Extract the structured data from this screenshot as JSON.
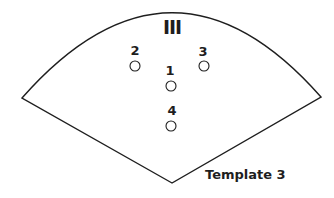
{
  "diagram": {
    "sector_label": "III",
    "caption": "Template 3",
    "positions": [
      {
        "label": "1",
        "cx": 171,
        "cy": 86
      },
      {
        "label": "2",
        "cx": 135,
        "cy": 66
      },
      {
        "label": "3",
        "cx": 204,
        "cy": 66
      },
      {
        "label": "4",
        "cx": 171,
        "cy": 126
      }
    ],
    "colors": {
      "stroke": "#1e1e1e",
      "background": "#ffffff"
    }
  }
}
